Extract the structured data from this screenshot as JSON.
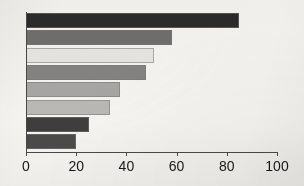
{
  "chart_data": {
    "type": "bar",
    "orientation": "horizontal",
    "title": "",
    "xlabel": "",
    "ylabel": "",
    "xlim": [
      0,
      100
    ],
    "xticks": [
      0,
      20,
      40,
      60,
      80,
      100
    ],
    "xtick_labels": [
      "0",
      "20",
      "40",
      "60",
      "80",
      "100"
    ],
    "grid": false,
    "legend": "none",
    "categories": [
      "1",
      "2",
      "3",
      "4",
      "5",
      "6",
      "7",
      "8"
    ],
    "values": [
      85,
      58,
      51,
      48,
      37.5,
      33.5,
      25,
      20
    ],
    "bar_colors": [
      "#2c2b2b",
      "#6e6d6c",
      "#e3e2df",
      "#838281",
      "#a6a5a3",
      "#b9b8b5",
      "#3f3e3e",
      "#4b4a49"
    ],
    "bars": [
      {
        "index": 1,
        "value": 85,
        "color": "#2c2b2b"
      },
      {
        "index": 2,
        "value": 58,
        "color": "#6e6d6c"
      },
      {
        "index": 3,
        "value": 51,
        "color": "#e3e2df"
      },
      {
        "index": 4,
        "value": 48,
        "color": "#838281"
      },
      {
        "index": 5,
        "value": 37.5,
        "color": "#a6a5a3"
      },
      {
        "index": 6,
        "value": 33.5,
        "color": "#b9b8b5"
      },
      {
        "index": 7,
        "value": 25,
        "color": "#3f3e3e"
      },
      {
        "index": 8,
        "value": 20,
        "color": "#4b4a49"
      }
    ]
  },
  "style": {
    "background_color": "#f3f1ed",
    "axis_color": "#4a4845",
    "tick_label_color": "#17161a",
    "bar_border_color": "#78766f"
  }
}
